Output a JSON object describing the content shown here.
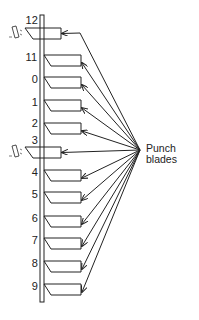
{
  "diagram": {
    "type": "punch-card-punch-mechanism",
    "callout": {
      "line1": "Punch",
      "line2": "blades"
    },
    "rows": [
      {
        "label": "12",
        "y": 28,
        "punched": true
      },
      {
        "label": "11",
        "y": 55,
        "punched": false
      },
      {
        "label": "0",
        "y": 77,
        "punched": false
      },
      {
        "label": "1",
        "y": 100,
        "punched": false
      },
      {
        "label": "2",
        "y": 123,
        "punched": false
      },
      {
        "label": "3",
        "y": 147,
        "punched": true
      },
      {
        "label": "4",
        "y": 170,
        "punched": false
      },
      {
        "label": "5",
        "y": 192,
        "punched": false
      },
      {
        "label": "6",
        "y": 216,
        "punched": false
      },
      {
        "label": "7",
        "y": 238,
        "punched": false
      },
      {
        "label": "8",
        "y": 261,
        "punched": false
      },
      {
        "label": "9",
        "y": 284,
        "punched": false
      }
    ],
    "convergence_point": {
      "x": 140,
      "y": 150
    },
    "stroke_color": "#222222"
  }
}
